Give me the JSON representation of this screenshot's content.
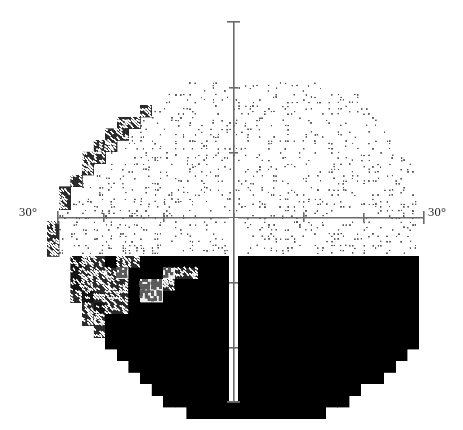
{
  "chart_data": {
    "type": "heatmap",
    "title": "",
    "subtitle": "",
    "xlabel": "",
    "ylabel": "",
    "legend": [],
    "grid": false,
    "axis": {
      "horizontal_label_left": "30°",
      "horizontal_label_right": "30°",
      "center_x": 233,
      "center_y": 217,
      "h_axis_x0": 57,
      "h_axis_x1": 423,
      "v_axis_y0": 21,
      "v_axis_y1": 401,
      "axis_color": "#6b6b6b",
      "axis_width": 1.6,
      "tick_len": 9,
      "end_tick_len": 13,
      "h_ticks_x": [
        57,
        103,
        163,
        233,
        303,
        363,
        423
      ],
      "v_ticks_y": [
        21,
        87,
        152,
        217,
        282,
        347,
        401
      ]
    },
    "cell": {
      "w": 11.6,
      "h": 11.6,
      "cols": 32,
      "rows": 33,
      "origin_x": 47,
      "origin_y": 47
    },
    "scale_levels": [
      {
        "id": 0,
        "name": "blank",
        "fill": "#ffffff",
        "density": 0.0,
        "dot": 0.0
      },
      {
        "id": 1,
        "name": "very-light",
        "fill": "#ffffff",
        "density": 0.16,
        "dot": 1.5
      },
      {
        "id": 2,
        "name": "light",
        "fill": "#ffffff",
        "density": 0.26,
        "dot": 1.9
      },
      {
        "id": 3,
        "name": "light-mid",
        "fill": "#ffffff",
        "density": 0.38,
        "dot": 2.2
      },
      {
        "id": 4,
        "name": "mid",
        "fill": "#ffffff",
        "density": 0.55,
        "dot": 2.6
      },
      {
        "id": 5,
        "name": "mid-dark",
        "fill": "#efefef",
        "density": 0.72,
        "dot": 3.1
      },
      {
        "id": 6,
        "name": "dark",
        "fill": "#2a2a2a",
        "density": 0.55,
        "dot": 3.0
      },
      {
        "id": 7,
        "name": "very-dark",
        "fill": "#141414",
        "density": 0.32,
        "dot": 2.6
      },
      {
        "id": 8,
        "name": "near-black",
        "fill": "#050505",
        "density": 0.14,
        "dot": 2.2
      },
      {
        "id": 9,
        "name": "black",
        "fill": "#000000",
        "density": 0.0,
        "dot": 0.0
      }
    ],
    "colors": {
      "background": "#ffffff",
      "ink": "#5a5a5a",
      "black": "#000000",
      "axis": "#6b6b6b"
    },
    "rows": [
      "00000000000000000000000000000000",
      "00000000000000000000000000000000",
      "00000000000000000000000000000000",
      "00000000000011111111111100000000",
      "00000000001111111111111111100000",
      "00000000611111111111111111110000",
      "00000066111111111111111111111000",
      "00000661111111111111111111111100",
      "00006611111111111111111111111100",
      "00066111111111111111111111111110",
      "00061111111111111111111111111111",
      "00611111111111111111111111111111",
      "06111111111111111111111111111111",
      "06111111111111111111111111111111",
      "01111111111111111111111111111111",
      "61111111111111111111111111111111",
      "61111111111111111111111111111111",
      "61111111111111111111111111111111",
      "00766966999999999999999999999999",
      "00766659995669999999999999999999",
      "00766669556999999999999999999999",
      "00676669559999999999999999999999",
      "00067669999999999999999999999999",
      "00066999999999999999999999999999",
      "00006999999999999999999999999999",
      "00000999999999999999999999999999",
      "00000099999999999999999999999990",
      "00000009999999999999999999999900",
      "00000000999999999999999999999000",
      "00000000099999999999999999900000",
      "00000000009999999999999999000000",
      "00000000000099999999999900000000",
      "00000000000000000000000000000000"
    ],
    "rows_right_offset": 0,
    "notes": {
      "hemifield_split_row": 18,
      "vertical_meridian_col": 16,
      "superior_mean_level": 1,
      "inferior_mean_level": 9
    }
  },
  "page": {
    "width": 463,
    "height": 430
  }
}
